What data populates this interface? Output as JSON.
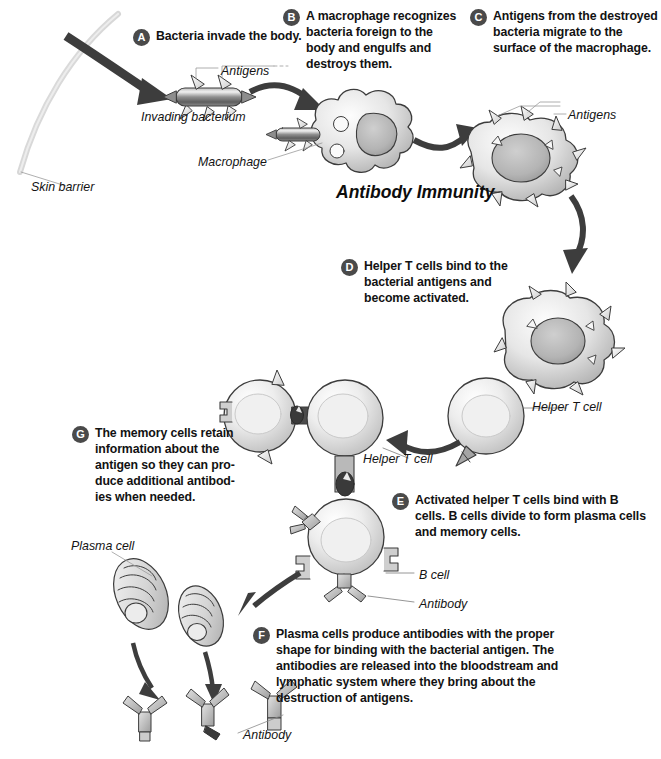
{
  "figure": {
    "title": "Antibody Immunity",
    "domain": "biology-diagram",
    "palette": {
      "badge_fill": "#4a4a4a",
      "badge_text": "#ffffff",
      "body_text": "#121212",
      "label_text": "#141414",
      "arrow_dark": "#3a3a3a",
      "leader_line": "#8a8a8a",
      "skin_barrier": "#d2d2d2",
      "cell_outline": "#3c3c3c",
      "cell_fill_light": "#f2f2f2",
      "cell_fill_mid": "#cfcfcf",
      "cell_fill_dark": "#9a9a9a",
      "background": "#ffffff"
    }
  },
  "steps": [
    {
      "id": "A",
      "letter": "A",
      "text": "Bacteria invade the body."
    },
    {
      "id": "B",
      "letter": "B",
      "text": "A macrophage recognizes bacteria foreign to the body and engulfs and destroys them."
    },
    {
      "id": "C",
      "letter": "C",
      "text": "Antigens from the destroyed bacteria migrate to the surface of the macrophage."
    },
    {
      "id": "D",
      "letter": "D",
      "text": "Helper T cells bind to the bacterial antigens and become activated."
    },
    {
      "id": "E",
      "letter": "E",
      "text": "Activated helper T cells bind with B cells. B cells divide to form plasma cells and memory cells."
    },
    {
      "id": "F",
      "letter": "F",
      "text": "Plasma cells produce antibodies with the proper shape for binding with the bacterial antigen. The antibodies are released into the bloodstream and lymphatic system where they bring about the destruction of antigens."
    },
    {
      "id": "G",
      "letter": "G",
      "text": "The memory cells retain information about the antigen so they can pro-duce additional antibod-ies when needed."
    }
  ],
  "labels": {
    "antigens_bacterium": "Antigens",
    "invading_bacterium": "Invading bacterium",
    "macrophage": "Macrophage",
    "skin_barrier": "Skin barrier",
    "antigens_macrophage": "Antigens",
    "helper_t_cell_right": "Helper T cell",
    "helper_t_cell_middle": "Helper T cell",
    "b_cell": "B cell",
    "antibody_b_cell": "Antibody",
    "plasma_cell": "Plasma cell",
    "antibody_free": "Antibody"
  }
}
